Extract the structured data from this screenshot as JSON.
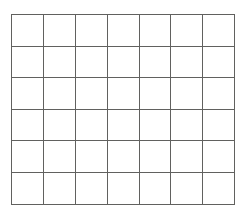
{
  "diagram": {
    "name": "blank-grid",
    "type": "grid",
    "columns": 7,
    "rows": 6,
    "colors": {
      "background": "#ffffff",
      "line": "#61615f",
      "cell_fill": "#ffffff"
    },
    "geometry": {
      "left": 11,
      "top": 14,
      "right": 227,
      "bottom": 204,
      "width": 216,
      "height": 190,
      "cell_width": 30.9,
      "cell_height": 31.6,
      "line_width": 1.4
    },
    "cells": [
      [
        "",
        "",
        "",
        "",
        "",
        "",
        ""
      ],
      [
        "",
        "",
        "",
        "",
        "",
        "",
        ""
      ],
      [
        "",
        "",
        "",
        "",
        "",
        "",
        ""
      ],
      [
        "",
        "",
        "",
        "",
        "",
        "",
        ""
      ],
      [
        "",
        "",
        "",
        "",
        "",
        "",
        ""
      ],
      [
        "",
        "",
        "",
        "",
        "",
        "",
        ""
      ]
    ]
  }
}
